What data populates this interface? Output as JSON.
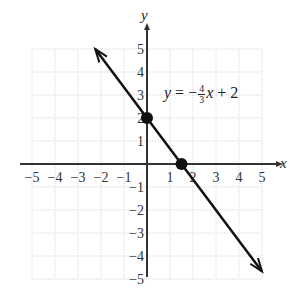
{
  "chart_data": {
    "type": "line",
    "title": "",
    "xlabel": "x",
    "ylabel": "y",
    "xlim": [
      -5,
      5
    ],
    "ylim": [
      -5,
      5
    ],
    "grid": true,
    "x_ticks": [
      "-5",
      "-4",
      "-3",
      "-2",
      "-1",
      "1",
      "2",
      "3",
      "4",
      "5"
    ],
    "y_ticks": [
      "5",
      "4",
      "3",
      "2",
      "1",
      "-1",
      "-2",
      "-3",
      "-4",
      "-5"
    ],
    "series": [
      {
        "name": "y = -4/3 x + 2",
        "equation": {
          "slope": "-4/3",
          "intercept": "2"
        },
        "x": [
          -2.25,
          5
        ],
        "y": [
          5,
          -4.67
        ],
        "arrows": "both"
      }
    ],
    "points": [
      {
        "label": "y-intercept",
        "x": 0,
        "y": 2
      },
      {
        "label": "x-intercept",
        "x": 1.5,
        "y": 0
      }
    ],
    "annotations": [
      {
        "text": "y = -4/3 x + 2",
        "x": 0.8,
        "y": 2.7
      }
    ]
  },
  "equation": {
    "lhs": "y",
    "eq": "=",
    "sign": "−",
    "num": "4",
    "den": "3",
    "var": "x",
    "rest": "+ 2"
  },
  "axes": {
    "x_label": "x",
    "y_label": "y"
  }
}
